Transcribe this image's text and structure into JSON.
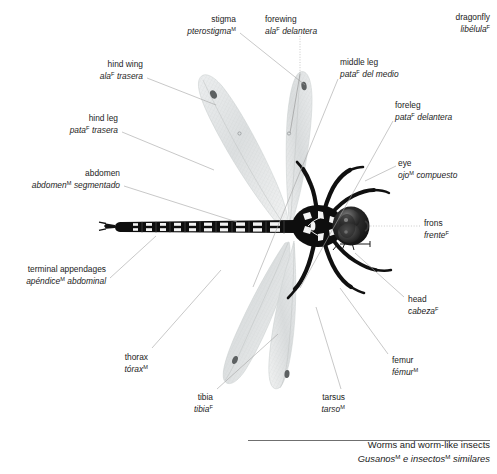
{
  "title": {
    "en": "dragonfly",
    "es": "libélula",
    "es_gender": "F"
  },
  "footer": {
    "en": "Worms and worm-like insects",
    "es_part1": "Gusanos",
    "es_gender1": "M",
    "es_part2": " e insectos",
    "es_gender2": "M",
    "es_part3": " similares"
  },
  "labels": [
    {
      "id": "stigma",
      "en": "stigma",
      "es": "pterostigma",
      "gender": "M",
      "align": "right",
      "x": 236,
      "y": 14
    },
    {
      "id": "forewing",
      "en": "forewing",
      "es": "ala",
      "gender": "F",
      "es_tail": "delantera",
      "align": "left",
      "x": 265,
      "y": 14
    },
    {
      "id": "middle-leg",
      "en": "middle leg",
      "es": "pata",
      "gender": "F",
      "es_tail": "del medio",
      "align": "left",
      "x": 340,
      "y": 57
    },
    {
      "id": "hind-wing",
      "en": "hind wing",
      "es": "ala",
      "gender": "F",
      "es_tail": "trasera",
      "align": "right",
      "x": 143,
      "y": 59
    },
    {
      "id": "foreleg",
      "en": "foreleg",
      "es": "pata",
      "gender": "F",
      "es_tail": "delantera",
      "align": "left",
      "x": 395,
      "y": 100
    },
    {
      "id": "hind-leg",
      "en": "hind leg",
      "es": "pata",
      "gender": "F",
      "es_tail": "trasera",
      "align": "right",
      "x": 118,
      "y": 113
    },
    {
      "id": "eye",
      "en": "eye",
      "es": "ojo",
      "gender": "M",
      "es_tail": "compuesto",
      "align": "left",
      "x": 398,
      "y": 158
    },
    {
      "id": "abdomen",
      "en": "abdomen",
      "es": "abdomen",
      "gender": "M",
      "es_tail": "segmentado",
      "align": "right",
      "x": 120,
      "y": 168
    },
    {
      "id": "frons",
      "en": "frons",
      "es": "frente",
      "gender": "F",
      "gender_pos": "after",
      "align": "left",
      "x": 424,
      "y": 218
    },
    {
      "id": "terminal-appendages",
      "en": "terminal appendages",
      "es": "apéndice",
      "gender": "M",
      "es_tail": "abdominal",
      "align": "right",
      "x": 106,
      "y": 264
    },
    {
      "id": "head",
      "en": "head",
      "es": "cabeza",
      "gender": "F",
      "gender_pos": "after",
      "align": "left",
      "x": 408,
      "y": 294
    },
    {
      "id": "thorax",
      "en": "thorax",
      "es": "tórax",
      "gender": "M",
      "gender_pos": "after",
      "align": "right",
      "x": 148,
      "y": 352
    },
    {
      "id": "femur",
      "en": "femur",
      "es": "fémur",
      "gender": "M",
      "gender_pos": "after",
      "align": "left",
      "x": 392,
      "y": 355
    },
    {
      "id": "tibia",
      "en": "tibia",
      "es": "tibia",
      "gender": "F",
      "gender_pos": "after",
      "align": "right",
      "x": 213,
      "y": 392
    },
    {
      "id": "tarsus",
      "en": "tarsus",
      "es": "tarso",
      "gender": "M",
      "gender_pos": "after",
      "align": "right",
      "x": 345,
      "y": 392
    }
  ],
  "colors": {
    "text": "#1c1c1c",
    "leader": "#9a9a9a",
    "rule": "#6f6f6f",
    "body_dark": "#141414",
    "wing": "#d8dadb",
    "background": "#ffffff"
  }
}
